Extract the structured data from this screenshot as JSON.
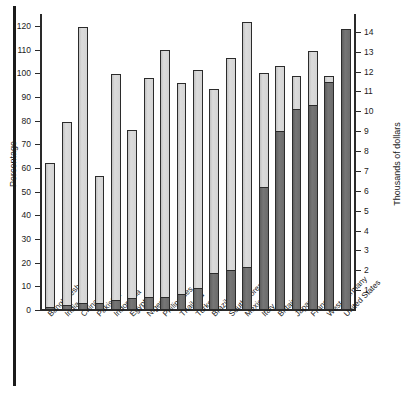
{
  "chart_data": {
    "type": "bar",
    "title": "",
    "subtitle": "",
    "xlabel": "",
    "ylabel": "Percentage",
    "y2label": "Thousands of dollars",
    "ylim": [
      0,
      125
    ],
    "y2lim": [
      0,
      14.9
    ],
    "grid": false,
    "legend_position": "none",
    "categories": [
      "Bangladesh",
      "India",
      "China",
      "Pakistan",
      "Indonesia",
      "Egypt",
      "Nigeria",
      "Philippines",
      "Thailand",
      "Turkey",
      "Brazil",
      "South Korea",
      "Mexico",
      "Italy",
      "Britain",
      "Japan",
      "France",
      "West Germany",
      "United States"
    ],
    "series": [
      {
        "name": "Percentage",
        "axis": "left",
        "color": "#d2d2d2",
        "values": [
          62,
          79.5,
          119.5,
          56.5,
          99.5,
          76,
          98,
          110,
          96,
          101.5,
          93.5,
          106.5,
          121.5,
          100,
          103,
          99,
          109.5,
          99,
          99
        ]
      },
      {
        "name": "Thousands of dollars",
        "axis": "right",
        "color": "#6e6e6e",
        "values": [
          0.15,
          0.25,
          0.35,
          0.35,
          0.5,
          0.6,
          0.65,
          0.65,
          0.8,
          1.1,
          1.85,
          2.0,
          2.15,
          6.2,
          9.0,
          10.1,
          10.3,
          11.5,
          14.15
        ]
      }
    ],
    "left_axis_ticks": [
      "0",
      "10",
      "20",
      "30",
      "40",
      "50",
      "60",
      "70",
      "80",
      "90",
      "100",
      "110",
      "120"
    ],
    "right_axis_ticks": [
      "1",
      "2",
      "3",
      "4",
      "5",
      "6",
      "7",
      "8",
      "9",
      "10",
      "11",
      "12",
      "13",
      "14"
    ]
  }
}
